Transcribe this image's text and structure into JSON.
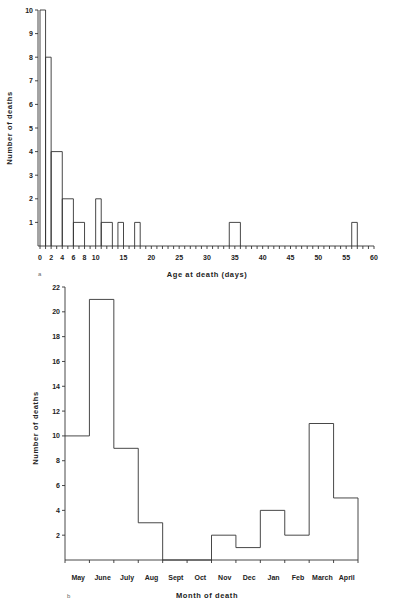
{
  "chart_data": [
    {
      "panel": "a",
      "type": "bar",
      "subtype": "histogram",
      "xlabel": "Age at death   (days)",
      "ylabel": "Number of deaths",
      "xlim": [
        0,
        60
      ],
      "ylim": [
        0,
        10
      ],
      "xticks": [
        0,
        2,
        4,
        6,
        8,
        10,
        15,
        20,
        25,
        30,
        35,
        40,
        45,
        50,
        55,
        60
      ],
      "yticks": [
        1,
        2,
        3,
        4,
        5,
        6,
        7,
        8,
        9,
        10
      ],
      "grid": false,
      "bins": [
        {
          "x0": 0,
          "x1": 1,
          "value": 10
        },
        {
          "x0": 1,
          "x1": 2,
          "value": 8
        },
        {
          "x0": 2,
          "x1": 4,
          "value": 4
        },
        {
          "x0": 4,
          "x1": 6,
          "value": 2
        },
        {
          "x0": 6,
          "x1": 8,
          "value": 1
        },
        {
          "x0": 10,
          "x1": 11,
          "value": 2
        },
        {
          "x0": 11,
          "x1": 13,
          "value": 1
        },
        {
          "x0": 14,
          "x1": 15,
          "value": 1
        },
        {
          "x0": 17,
          "x1": 18,
          "value": 1
        },
        {
          "x0": 34,
          "x1": 36,
          "value": 1
        },
        {
          "x0": 56,
          "x1": 57,
          "value": 1
        }
      ]
    },
    {
      "panel": "b",
      "type": "bar",
      "subtype": "histogram",
      "xlabel": "Month of death",
      "ylabel": "Number of deaths",
      "ylim": [
        0,
        22
      ],
      "yticks": [
        2,
        4,
        6,
        8,
        10,
        12,
        14,
        16,
        18,
        20,
        22
      ],
      "grid": false,
      "categories": [
        "May",
        "June",
        "July",
        "Aug",
        "Sept",
        "Oct",
        "Nov",
        "Dec",
        "Jan",
        "Feb",
        "March",
        "April"
      ],
      "values": [
        10,
        21,
        9,
        3,
        0,
        0,
        2,
        1,
        4,
        2,
        11,
        5
      ]
    }
  ],
  "labels": {
    "panel_a": "a",
    "panel_b": "b",
    "a_xlabel": "Age at death   (days)",
    "a_ylabel": "Number of deaths",
    "b_xlabel": "Month of death",
    "b_ylabel": "Number of deaths"
  }
}
